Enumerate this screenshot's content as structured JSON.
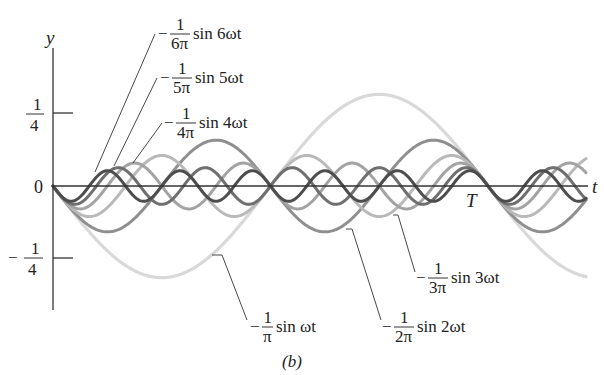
{
  "caption": "(b)",
  "chart_data": {
    "type": "line",
    "title": "",
    "xlabel": "t",
    "ylabel": "y",
    "x_tick_labels": [
      "0",
      "T"
    ],
    "y_tick_labels": [
      "1/4",
      "0",
      "-1/4"
    ],
    "y_ticks": [
      0.25,
      0,
      -0.25
    ],
    "xlim_periods": [
      0,
      1.23
    ],
    "ylim": [
      -0.35,
      0.35
    ],
    "grid": false,
    "legend": "leader-line annotations",
    "series": [
      {
        "name": "-1/π sin ωt",
        "n": 1,
        "amplitude": 0.3183,
        "color": "#d9d9d9",
        "width": 3.2
      },
      {
        "name": "-1/2π sin 2ωt",
        "n": 2,
        "amplitude": 0.1592,
        "color": "#8f8f8f",
        "width": 3
      },
      {
        "name": "-1/3π sin 3ωt",
        "n": 3,
        "amplitude": 0.1061,
        "color": "#b9b9b9",
        "width": 3
      },
      {
        "name": "-1/4π sin 4ωt",
        "n": 4,
        "amplitude": 0.0796,
        "color": "#a3a3a3",
        "width": 3
      },
      {
        "name": "-1/5π sin 5ωt",
        "n": 5,
        "amplitude": 0.0637,
        "color": "#6f6f6f",
        "width": 3
      },
      {
        "name": "-1/6π sin 6ωt",
        "n": 6,
        "amplitude": 0.0531,
        "color": "#4d4d4d",
        "width": 3
      }
    ]
  },
  "labels": {
    "y_axis": "y",
    "t_axis": "t",
    "origin": "0",
    "period": "T",
    "tick_pos_num": "1",
    "tick_pos_den": "4",
    "tick_neg_sign": "−",
    "tick_neg_num": "1",
    "tick_neg_den": "4"
  },
  "annotations": [
    {
      "n": 6,
      "minus": "−",
      "num": "1",
      "den": "6π",
      "func": "sin 6ωt",
      "tx": 158,
      "ty": 34,
      "line": [
        [
          95,
          172
        ],
        [
          155,
          34
        ]
      ]
    },
    {
      "n": 5,
      "minus": "−",
      "num": "1",
      "den": "5π",
      "func": "sin 5ωt",
      "tx": 160,
      "ty": 78,
      "line": [
        [
          114,
          166
        ],
        [
          157,
          78
        ]
      ]
    },
    {
      "n": 4,
      "minus": "−",
      "num": "1",
      "den": "4π",
      "func": "sin 4ωt",
      "tx": 164,
      "ty": 123,
      "line": [
        [
          133,
          163
        ],
        [
          162,
          123
        ]
      ]
    },
    {
      "n": 1,
      "minus": "−",
      "num": "1",
      "den": "π",
      "func": "sin ωt",
      "tx": 250,
      "ty": 327,
      "line": [
        [
          212,
          255
        ],
        [
          222,
          255
        ],
        [
          247,
          320
        ]
      ]
    },
    {
      "n": 2,
      "minus": "−",
      "num": "1",
      "den": "2π",
      "func": "sin 2ωt",
      "tx": 382,
      "ty": 327,
      "line": [
        [
          346,
          229
        ],
        [
          352,
          229
        ],
        [
          381,
          320
        ]
      ]
    },
    {
      "n": 3,
      "minus": "−",
      "num": "1",
      "den": "3π",
      "func": "sin 3ωt",
      "tx": 416,
      "ty": 278,
      "line": [
        [
          393,
          215
        ],
        [
          398,
          215
        ],
        [
          415,
          272
        ]
      ]
    }
  ]
}
